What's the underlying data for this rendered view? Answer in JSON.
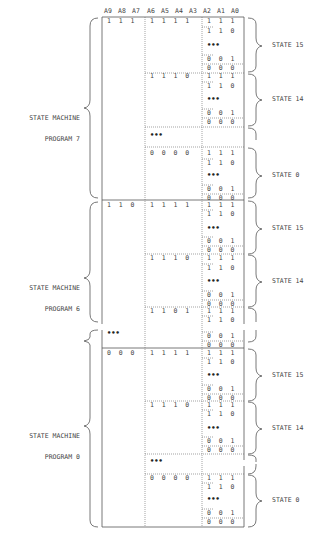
{
  "header": {
    "columns": [
      "A9",
      "A8",
      "A7",
      "A6",
      "A5",
      "A4",
      "A3",
      "A2",
      "A1",
      "A0"
    ]
  },
  "programs": [
    {
      "label_line1": "STATE MACHINE",
      "label_line2": "PROGRAM 7",
      "high_bits": "1  1  1",
      "states": [
        {
          "label": "STATE 15",
          "mid_bits": "1  1  1  1",
          "rows": [
            "1  1  1",
            "1  1  0",
            "•••",
            "0  0  1",
            "0  0  0"
          ]
        },
        {
          "label": "STATE 14",
          "mid_bits": "1  1  1  0",
          "rows": [
            "1  1  1",
            "1  1  0",
            "•••",
            "0  0  1",
            "0  0  0"
          ]
        },
        {
          "label": "STATE 0",
          "mid_bits": "0  0  0  0",
          "rows": [
            "1  1  1",
            "1  1  0",
            "•••",
            "0  0  1",
            "0  0  0"
          ]
        }
      ]
    },
    {
      "label_line1": "STATE MACHINE",
      "label_line2": "PROGRAM 6",
      "high_bits": "1  1  0",
      "states": [
        {
          "label": "STATE 15",
          "mid_bits": "1  1  1  1",
          "rows": [
            "1  1  1",
            "1  1  0",
            "•••",
            "0  0  1",
            "0  0  0"
          ]
        },
        {
          "label": "STATE 14",
          "mid_bits": "1  1  1  0",
          "rows": [
            "1  1  1",
            "1  1  0",
            "•••",
            "0  0  1",
            "0  0  0"
          ]
        },
        {
          "label": "",
          "mid_bits": "1  1  0  1",
          "rows": [
            "1  1  1",
            "1  1  0"
          ]
        }
      ]
    },
    {
      "label_line1": "STATE MACHINE",
      "label_line2": "PROGRAM 0",
      "high_bits": "0  0  0",
      "states": [
        {
          "label": "STATE 15",
          "mid_bits": "1  1  1  1",
          "rows": [
            "1  1  1",
            "1  1  0",
            "•••",
            "0  0  1",
            "0  0  0"
          ]
        },
        {
          "label": "STATE 14",
          "mid_bits": "1  1  1  0",
          "rows": [
            "1  1  1",
            "1  1  0",
            "•••",
            "0  0  1",
            "0  0  0"
          ]
        },
        {
          "label": "STATE 0",
          "mid_bits": "0  0  0  0",
          "rows": [
            "1  1  1",
            "1  1  0",
            "•••",
            "0  0  1",
            "0  0  0"
          ]
        }
      ]
    }
  ],
  "gap": {
    "dots": "•••",
    "rows": [
      "0  0  1",
      "0  0  0"
    ]
  },
  "state_gap_dots": "•••"
}
